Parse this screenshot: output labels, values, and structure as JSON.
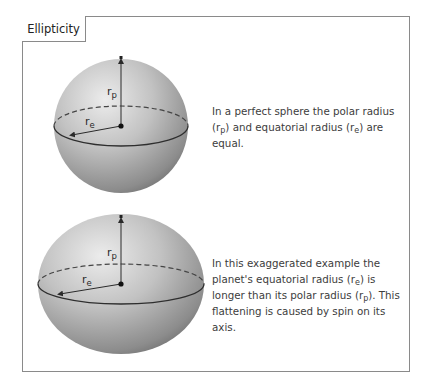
{
  "title": "Ellipticity",
  "labels": {
    "polar_radius": "r",
    "polar_sub": "p",
    "equatorial_radius": "r",
    "equatorial_sub": "e"
  },
  "panels": [
    {
      "shape": "sphere",
      "caption": {
        "part1": "In a perfect sphere the polar radius (r",
        "sub1": "p",
        "part2": ") and equatorial radius (r",
        "sub2": "e",
        "part3": ") are equal."
      }
    },
    {
      "shape": "oblate-spheroid",
      "caption": {
        "part1": "In this exaggerated example the planet's equatorial radius (r",
        "sub1": "e",
        "part2": ") is longer than its polar radius (r",
        "sub2": "p",
        "part3": "). This flattening is caused by spin on its axis."
      }
    }
  ],
  "colors": {
    "frame_border": "#8a8a8a",
    "sphere_light": "#e6e6e6",
    "sphere_mid": "#b4b4b4",
    "sphere_dark": "#6e6e6e",
    "line": "#2a2a2a"
  }
}
